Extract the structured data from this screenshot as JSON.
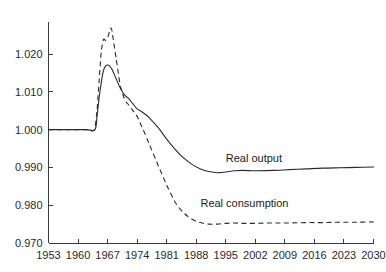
{
  "chart_data": {
    "type": "line",
    "title": "",
    "xlabel": "",
    "ylabel": "",
    "xlim": [
      1953,
      2030
    ],
    "ylim": [
      0.97,
      1.028
    ],
    "grid": false,
    "legend_position": "inline-annotation",
    "xticks": [
      1953,
      1960,
      1967,
      1974,
      1981,
      1988,
      1995,
      2002,
      2009,
      2016,
      2023,
      2030
    ],
    "xtick_labels": [
      "1953",
      "1960",
      "1967",
      "1974",
      "1981",
      "1988",
      "1995",
      "2002",
      "2009",
      "2016",
      "2023",
      "2030"
    ],
    "yticks": [
      0.97,
      0.98,
      0.99,
      1.0,
      1.01,
      1.02
    ],
    "ytick_labels": [
      "0.970",
      "0.980",
      "0.990",
      "1.000",
      "1.010",
      "1.020"
    ],
    "annotations": [
      {
        "text": "Real output",
        "x": 1995,
        "y": 0.9915
      },
      {
        "text": "Real consumption",
        "x": 1989,
        "y": 0.9795
      }
    ],
    "series": [
      {
        "name": "Real output",
        "style": "solid",
        "label": "Real output",
        "x": [
          1953,
          1956,
          1959,
          1962,
          1964,
          1964.5,
          1965,
          1965.5,
          1966,
          1966.5,
          1967,
          1967.5,
          1968,
          1969,
          1970,
          1971,
          1972,
          1973,
          1974,
          1975,
          1976,
          1977,
          1979,
          1981,
          1983,
          1985,
          1987,
          1989,
          1991,
          1993,
          1995,
          1997,
          1999,
          2002,
          2006,
          2010,
          2014,
          2018,
          2022,
          2026,
          2030
        ],
        "y": [
          1.0,
          1.0,
          1.0,
          1.0,
          1.0,
          1.0035,
          1.0085,
          1.0125,
          1.0155,
          1.0168,
          1.0171,
          1.0168,
          1.016,
          1.0135,
          1.011,
          1.0092,
          1.0082,
          1.0068,
          1.0055,
          1.0048,
          1.004,
          1.003,
          1.0005,
          0.9975,
          0.9948,
          0.9925,
          0.9908,
          0.9896,
          0.9889,
          0.9886,
          0.9888,
          0.9891,
          0.9892,
          0.9891,
          0.9892,
          0.9894,
          0.9896,
          0.9898,
          0.9899,
          0.99,
          0.9901
        ]
      },
      {
        "name": "Real consumption",
        "style": "dashed",
        "label": "Real consumption",
        "x": [
          1953,
          1956,
          1959,
          1962,
          1964,
          1964.5,
          1965,
          1965.5,
          1966,
          1966.5,
          1967,
          1967.5,
          1968,
          1969,
          1970,
          1971,
          1972,
          1973,
          1974,
          1975,
          1976,
          1977,
          1979,
          1981,
          1983,
          1985,
          1987,
          1989,
          1991,
          1993,
          1995,
          1997,
          1999,
          2002,
          2006,
          2010,
          2014,
          2018,
          2022,
          2026,
          2030
        ],
        "y": [
          1.0,
          1.0,
          1.0,
          1.0,
          1.0,
          1.005,
          1.013,
          1.021,
          1.0238,
          1.0236,
          1.0243,
          1.026,
          1.0264,
          1.019,
          1.0115,
          1.008,
          1.0065,
          1.005,
          1.0035,
          1.001,
          0.9985,
          0.9958,
          0.9905,
          0.9853,
          0.9808,
          0.978,
          0.9763,
          0.9754,
          0.975,
          0.975,
          0.9752,
          0.9753,
          0.9752,
          0.9752,
          0.9753,
          0.9753,
          0.9754,
          0.9754,
          0.9755,
          0.9755,
          0.9756
        ]
      }
    ]
  },
  "axes": {
    "y_axis_name": "value-axis",
    "x_axis_name": "year-axis"
  }
}
